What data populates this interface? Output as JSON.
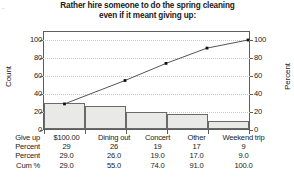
{
  "corner_mark": "..",
  "chart_data": {
    "type": "bar",
    "title": "Rather hire someone to do the spring cleaning even if it meant giving up:",
    "title_line1": "Rather hire someone to do the spring cleaning",
    "title_line2": "even if it meant giving up:",
    "categories": [
      "$100.00",
      "Dining out",
      "Concert",
      "Other",
      "Weekend trip"
    ],
    "values": [
      29,
      26,
      19,
      17,
      9
    ],
    "series": [
      {
        "name": "Count",
        "type": "bar",
        "values": [
          29,
          26,
          19,
          17,
          9
        ]
      },
      {
        "name": "Cum %",
        "type": "line",
        "values": [
          29.0,
          55.0,
          74.0,
          91.0,
          100.0
        ]
      }
    ],
    "percent": [
      29.0,
      26.0,
      19.0,
      17.0,
      9.0
    ],
    "cum_percent": [
      29.0,
      55.0,
      74.0,
      91.0,
      100.0
    ],
    "xlabel": "",
    "ylabel": "Count",
    "y2label": "Percent",
    "ylim": [
      0,
      110
    ],
    "y2lim": [
      0,
      110
    ],
    "yticks": [
      0,
      20,
      40,
      60,
      80,
      100
    ],
    "y2ticks": [
      0,
      20,
      40,
      60,
      80,
      100
    ],
    "grid": true,
    "legend": "none",
    "bar_fill": "#e9e9e7",
    "bar_border": "#6a6a6a",
    "line_color": "#555555",
    "marker_color": "#111111"
  },
  "axes": {
    "left_title": "Count",
    "right_title": "Percent",
    "left_ticks": [
      "100",
      "80",
      "60",
      "40",
      "20",
      "0"
    ],
    "right_ticks": [
      "100",
      "80",
      "60",
      "40",
      "20",
      "0"
    ]
  },
  "table": {
    "rows": [
      {
        "label": "Give up",
        "cells": [
          "$100.00",
          "Dining out",
          "Concert",
          "Other",
          "Weekend trip"
        ]
      },
      {
        "label": "Percent",
        "cells": [
          "29",
          "26",
          "19",
          "17",
          "9"
        ]
      },
      {
        "label": "Percent",
        "cells": [
          "29.0",
          "26.0",
          "19.0",
          "17.0",
          "9.0"
        ]
      },
      {
        "label": "Cum %",
        "cells": [
          "29.0",
          "55.0",
          "74.0",
          "91.0",
          "100.0"
        ]
      }
    ]
  }
}
